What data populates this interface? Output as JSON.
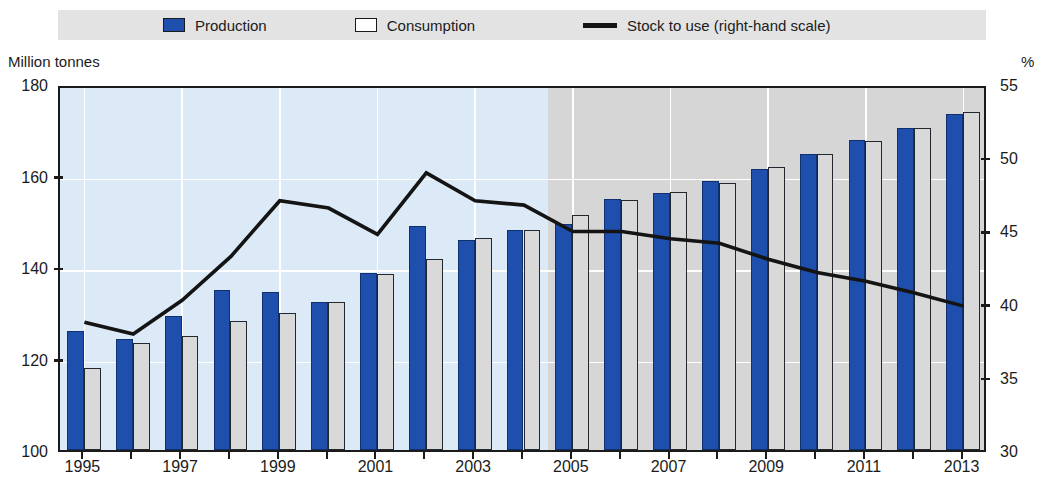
{
  "legend": {
    "items": [
      {
        "label": "Production",
        "icon": "blue-square-swatch",
        "color": "#1f4fad"
      },
      {
        "label": "Consumption",
        "icon": "white-square-swatch",
        "color": "#ffffff"
      },
      {
        "label": "Stock to use (right-hand scale)",
        "icon": "black-line-swatch",
        "color": "#141414"
      }
    ]
  },
  "axes": {
    "left_caption": "Million tonnes",
    "right_caption": "%"
  },
  "chart_data": {
    "type": "bar",
    "title": "",
    "subtitle": "",
    "xlabel": "",
    "ylabel": "Million tonnes",
    "y2label": "%",
    "ylim": [
      100,
      180
    ],
    "y2lim": [
      30,
      55
    ],
    "yticks": [
      100,
      120,
      140,
      160,
      180
    ],
    "y2ticks": [
      30,
      35,
      40,
      45,
      50,
      55
    ],
    "grid": true,
    "legend_position": "top",
    "x": [
      1995,
      1996,
      1997,
      1998,
      1999,
      2000,
      2001,
      2002,
      2003,
      2004,
      2005,
      2006,
      2007,
      2008,
      2009,
      2010,
      2011,
      2012,
      2013
    ],
    "xtick_labels": [
      "1995",
      "",
      "1997",
      "",
      "1999",
      "",
      "2001",
      "",
      "2003",
      "",
      "2005",
      "",
      "2007",
      "",
      "2009",
      "",
      "2011",
      "",
      "2013"
    ],
    "categories": [
      "1995",
      "1996",
      "1997",
      "1998",
      "1999",
      "2000",
      "2001",
      "2002",
      "2003",
      "2004",
      "2005",
      "2006",
      "2007",
      "2008",
      "2009",
      "2010",
      "2011",
      "2012",
      "2013"
    ],
    "series": [
      {
        "name": "Production",
        "type": "bar",
        "axis": "left",
        "color": "#1f4fad",
        "values": [
          126.0,
          124.3,
          129.2,
          134.9,
          134.5,
          132.4,
          138.7,
          148.9,
          145.9,
          148.0,
          149.3,
          154.8,
          156.2,
          158.8,
          161.4,
          164.7,
          167.7,
          170.4,
          173.4
        ]
      },
      {
        "name": "Consumption",
        "type": "bar",
        "axis": "left",
        "color": "#d9d9d9",
        "values": [
          118.0,
          123.4,
          125.0,
          128.2,
          130.0,
          132.3,
          138.4,
          141.7,
          146.3,
          148.0,
          151.4,
          154.7,
          156.3,
          158.4,
          161.8,
          164.7,
          167.6,
          170.4,
          173.8
        ]
      },
      {
        "name": "Stock to use (right-hand scale)",
        "type": "line",
        "axis": "right",
        "color": "#141414",
        "values": [
          39.0,
          38.2,
          40.5,
          43.5,
          47.3,
          46.8,
          45.0,
          49.2,
          47.3,
          47.0,
          45.2,
          45.2,
          44.7,
          44.4,
          43.3,
          42.4,
          41.8,
          41.0,
          40.1
        ]
      }
    ],
    "forecast_shading_from": 2005,
    "annotations": []
  }
}
